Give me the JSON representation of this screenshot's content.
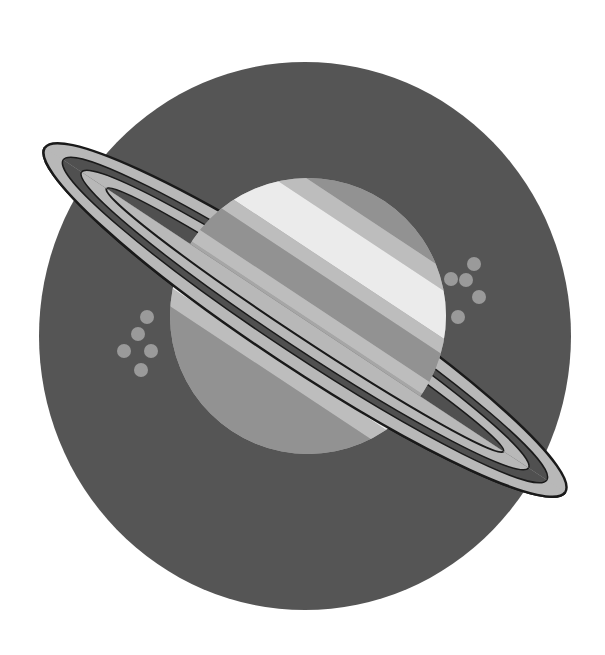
{
  "illustration": {
    "title": "Saturn illustration",
    "style": "grayscale flat vector",
    "subject": "ringed planet",
    "colors": {
      "background": "#ffffff",
      "backdrop_circle": "#555555",
      "ring_fill": "#b8b8b8",
      "ring_gap": "#505050",
      "ring_outline": "#1a1a1a",
      "planet_base": "#a6a6a6",
      "band_light": "#ebebeb",
      "band_mid": "#bdbdbd",
      "band_dark": "#929292",
      "star_dots": "#9a9a9a"
    },
    "star_clusters": [
      {
        "side": "left",
        "dot_count": 5
      },
      {
        "side": "right",
        "dot_count": 5
      }
    ],
    "ring_count": 2
  }
}
